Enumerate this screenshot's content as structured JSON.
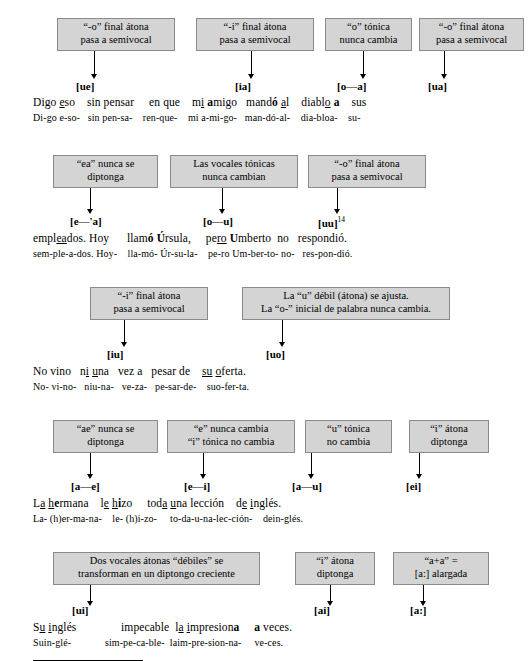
{
  "document": {
    "title": "Spanish synalepha and diphthong rules diagram"
  },
  "boxes": [
    {
      "id": "b1",
      "lines": [
        "“-o” final átona",
        "pasa a semivocal"
      ]
    },
    {
      "id": "b2",
      "lines": [
        "“-i” final átona",
        "pasa a semivocal"
      ]
    },
    {
      "id": "b3",
      "lines": [
        "“o” tónica",
        "nunca cambia"
      ]
    },
    {
      "id": "b4",
      "lines": [
        "“-o” final átona",
        "pasa a semivocal"
      ]
    },
    {
      "id": "b5",
      "lines": [
        "“ea” nunca se",
        "diptonga"
      ]
    },
    {
      "id": "b6",
      "lines": [
        "Las vocales tónicas",
        "nunca cambian"
      ]
    },
    {
      "id": "b7",
      "lines": [
        "“-o” final átona",
        "pasa a semivocal"
      ]
    },
    {
      "id": "b8",
      "lines": [
        "“-i” final átona",
        "pasa a semivocal"
      ]
    },
    {
      "id": "b9",
      "lines": [
        "La “u” débil (átona) se ajusta.",
        "La “o-” inicial de palabra nunca cambia."
      ]
    },
    {
      "id": "b10",
      "lines": [
        "“ae” nunca se",
        "diptonga"
      ]
    },
    {
      "id": "b11",
      "lines": [
        "“e” nunca cambia",
        "“i” tónica no cambia"
      ]
    },
    {
      "id": "b12",
      "lines": [
        "“u” tónica",
        "no cambia"
      ]
    },
    {
      "id": "b13",
      "lines": [
        "“i” átona",
        "diptonga"
      ]
    },
    {
      "id": "b14",
      "lines": [
        "Dos vocales átonas “débiles” se",
        "transforman en un diptongo creciente"
      ]
    },
    {
      "id": "b15",
      "lines": [
        "“i” átona",
        "diptonga"
      ]
    },
    {
      "id": "b16",
      "lines": [
        "“a+a” =",
        "[a:] alargada"
      ]
    }
  ],
  "phonetics": [
    {
      "id": "p1",
      "text": "[ue]"
    },
    {
      "id": "p2",
      "text": "[ia]"
    },
    {
      "id": "p3",
      "text": "[o—a]"
    },
    {
      "id": "p4",
      "text": "[ua]"
    },
    {
      "id": "p5",
      "text": "[e—'a]"
    },
    {
      "id": "p6",
      "text": "[o—u]"
    },
    {
      "id": "p7",
      "text": "[uu]",
      "note": "14"
    },
    {
      "id": "p8",
      "text": "[iu]"
    },
    {
      "id": "p9",
      "text": "[uo]"
    },
    {
      "id": "p10",
      "text": "[a—e]"
    },
    {
      "id": "p11",
      "text": "[e—i]"
    },
    {
      "id": "p12",
      "text": "[a—u]"
    },
    {
      "id": "p13",
      "text": "[ei]"
    },
    {
      "id": "p14",
      "text": "[ui]"
    },
    {
      "id": "p15",
      "text": "[ai]"
    },
    {
      "id": "p16",
      "text": "[a:]"
    }
  ],
  "rows": [
    {
      "id": "row1",
      "text_segments": [
        {
          "plain": "Digo "
        },
        {
          "underline": "e"
        },
        {
          "plain": "so"
        },
        {
          "gap": true
        },
        {
          "plain": "sin pensar"
        },
        {
          "gap": true
        },
        {
          "plain": "en que"
        },
        {
          "gap": true
        },
        {
          "plain": "m"
        },
        {
          "underline": "i"
        },
        {
          "plain": " "
        },
        {
          "bold": "a"
        },
        {
          "plain": "migo"
        },
        {
          "gap": true
        },
        {
          "plain": "mand"
        },
        {
          "bold": "ó"
        },
        {
          "plain": " "
        },
        {
          "underline": "a"
        },
        {
          "plain": "l"
        },
        {
          "gap": true
        },
        {
          "plain": "diabl"
        },
        {
          "underline": "o"
        },
        {
          "plain": " "
        },
        {
          "bold": "a"
        },
        {
          "gap": true
        },
        {
          "plain": "sus"
        }
      ],
      "line1": "Digo eso sin pensar en que mi amigo mandó al diablo a sus",
      "line2": "Di-go e-so- sin pen-sa- ren-que- mi a-mi-go- man-dó-al- dia-bloa- su-"
    },
    {
      "id": "row2",
      "line1": "empleádos. Hoy llamó Úrsula, pero Umberto no respondió.",
      "line2": "sem-ple-a-dos. Hoy- lla-mó- Úr-su-la- pe-ro Um-ber-to- no- res-pon-dió."
    },
    {
      "id": "row3",
      "line1": "No vino ni una vez a pesar de su oferta.",
      "line2": "No- vi-no- niu-na- vez-a- pe-sar-de- suo-fer-ta."
    },
    {
      "id": "row4",
      "line1": "La hermana le hizo toda una lección de inglés.",
      "line2": "La- (h)er-ma-na- le- (h)i-zo- to-da-u-na-lec-ción- dein-glés."
    },
    {
      "id": "row5",
      "line1": "Su inglés impecable la impresiona a veces.",
      "line2": "Suin-glé- sim-pe-ca-ble- laim-pre-sion-na- ve-ces."
    }
  ],
  "footnote_rule": true
}
